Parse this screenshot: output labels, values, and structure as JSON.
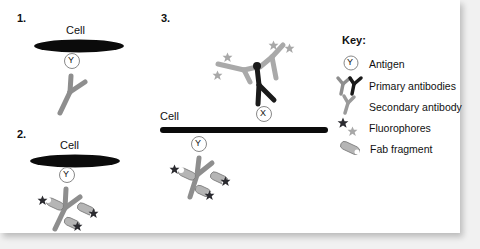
{
  "figure": {
    "panels": [
      {
        "number": "1.",
        "cell_label": "Cell",
        "antigen_label": "Y"
      },
      {
        "number": "2.",
        "cell_label": "Cell",
        "antigen_label": "Y"
      },
      {
        "number": "3.",
        "cell_label": "Cell",
        "antigen_label": "X",
        "second_antigen_label": "Y"
      }
    ],
    "key": {
      "title": "Key:",
      "items": [
        {
          "icon": "antigen-circle-icon",
          "label": "Antigen"
        },
        {
          "icon": "primary-antibodies-icon",
          "label": "Primary antibodies"
        },
        {
          "icon": "secondary-antibody-icon",
          "label": "Secondary antibody"
        },
        {
          "icon": "fluorophores-star-icon",
          "label": "Fluorophores"
        },
        {
          "icon": "fab-fragment-icon",
          "label": "Fab fragment"
        }
      ]
    },
    "colors": {
      "cell_membrane": "#0b0b0b",
      "antibody_gray": "#8e8e8e",
      "antibody_light": "#a9a9a9",
      "primary_dark": "#1a1a1a",
      "star_dark": "#2b2b30",
      "star_light": "#a8a8a8",
      "fab_fill": "#b5b5b5"
    }
  }
}
